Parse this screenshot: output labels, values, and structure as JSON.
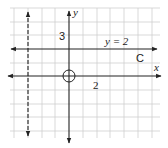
{
  "diagram": {
    "type": "coordinate-plane",
    "axes": {
      "x_label": "x",
      "y_label": "y"
    },
    "grid": {
      "spacing_units": 1,
      "color": "#cfcfcf"
    },
    "lines": [
      {
        "id": "horizontal-line",
        "equation": "y = 2",
        "label": "y = 2",
        "style": "solid"
      },
      {
        "id": "vertical-dashed-line",
        "equation": "x = -3",
        "style": "dashed"
      }
    ],
    "annotations": {
      "label_3": "3",
      "label_2": "2",
      "label_C": "C"
    },
    "origin_marker": "circle"
  },
  "colors": {
    "ink": "#222222",
    "grid": "#cfcfcf",
    "background": "#ffffff"
  }
}
